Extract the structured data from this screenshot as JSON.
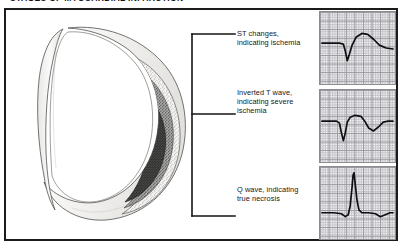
{
  "figure": {
    "title": "Stages of Myocardial Infarction",
    "frame_color": "#1b1b1b",
    "background": "#ffffff"
  },
  "illustration": {
    "name": "heart-cross-section",
    "description": "Cross-section of the left ventricle showing concentric zones of myocardial infarction",
    "zones": [
      {
        "name": "zone-ischemia",
        "label": "Zone of ischemia",
        "fill": "#f0efed",
        "pattern": "fine-stipple"
      },
      {
        "name": "zone-injury",
        "label": "Zone of injury",
        "fill": "#9a9a99",
        "pattern": "medium-stipple"
      },
      {
        "name": "zone-necrosis",
        "label": "Zone of necrosis",
        "fill": "#4a4a49",
        "pattern": "dense-stipple"
      }
    ],
    "myocardium_fill": "#f4f3f1",
    "outline_color": "#4b4b4b"
  },
  "callouts": [
    {
      "id": "st-changes",
      "text": "ST changes,\nindicating ischemia",
      "target_zone": "zone-ischemia"
    },
    {
      "id": "inverted-t-wave",
      "text": "Inverted T wave,\nindicating severe\nischemia",
      "target_zone": "zone-injury"
    },
    {
      "id": "q-wave",
      "text": "Q wave, indicating\ntrue necrosis",
      "target_zone": "zone-necrosis"
    }
  ],
  "chart_data": [
    {
      "type": "line",
      "id": "ecg-st-changes",
      "title": "ST changes, indicating ischemia",
      "xlabel": "",
      "ylabel": "",
      "grid": true,
      "legend": "none",
      "xlim": [
        0,
        77
      ],
      "ylim": [
        0,
        74
      ],
      "series": [
        {
          "name": "ECG tracing",
          "points": [
            [
              2,
              32
            ],
            [
              12,
              32
            ],
            [
              20,
              32
            ],
            [
              24,
              33
            ],
            [
              26,
              40
            ],
            [
              28,
              50
            ],
            [
              30,
              44
            ],
            [
              33,
              34
            ],
            [
              37,
              26
            ],
            [
              43,
              22
            ],
            [
              49,
              23
            ],
            [
              55,
              28
            ],
            [
              61,
              34
            ],
            [
              68,
              37
            ],
            [
              75,
              38
            ]
          ]
        }
      ],
      "annotations": [
        "elevated rounded ST segment and T wave"
      ]
    },
    {
      "type": "line",
      "id": "ecg-inverted-t-wave",
      "title": "Inverted T wave, indicating severe ischemia",
      "xlabel": "",
      "ylabel": "",
      "grid": true,
      "legend": "none",
      "xlim": [
        0,
        77
      ],
      "ylim": [
        0,
        74
      ],
      "series": [
        {
          "name": "ECG tracing",
          "points": [
            [
              2,
              32
            ],
            [
              12,
              32
            ],
            [
              17,
              32
            ],
            [
              20,
              34
            ],
            [
              22,
              44
            ],
            [
              24,
              52
            ],
            [
              26,
              44
            ],
            [
              28,
              33
            ],
            [
              31,
              28
            ],
            [
              36,
              26
            ],
            [
              42,
              27
            ],
            [
              46,
              32
            ],
            [
              50,
              39
            ],
            [
              55,
              42
            ],
            [
              60,
              38
            ],
            [
              65,
              33
            ],
            [
              70,
              32
            ],
            [
              75,
              32
            ]
          ]
        }
      ],
      "annotations": [
        "downward-deflected inverted T wave"
      ]
    },
    {
      "type": "line",
      "id": "ecg-q-wave",
      "title": "Q wave, indicating true necrosis",
      "xlabel": "",
      "ylabel": "",
      "grid": true,
      "legend": "none",
      "xlim": [
        0,
        77
      ],
      "ylim": [
        0,
        74
      ],
      "series": [
        {
          "name": "ECG tracing",
          "points": [
            [
              2,
              47
            ],
            [
              14,
              47
            ],
            [
              22,
              48
            ],
            [
              26,
              51
            ],
            [
              29,
              49
            ],
            [
              31,
              40
            ],
            [
              33,
              20
            ],
            [
              34,
              8
            ],
            [
              35,
              6
            ],
            [
              36,
              16
            ],
            [
              38,
              34
            ],
            [
              40,
              44
            ],
            [
              43,
              47
            ],
            [
              50,
              47
            ],
            [
              57,
              48
            ],
            [
              62,
              51
            ],
            [
              67,
              49
            ],
            [
              72,
              47
            ],
            [
              75,
              47
            ]
          ]
        }
      ],
      "annotations": [
        "deep pathological Q wave preceding tall R spike"
      ]
    }
  ]
}
